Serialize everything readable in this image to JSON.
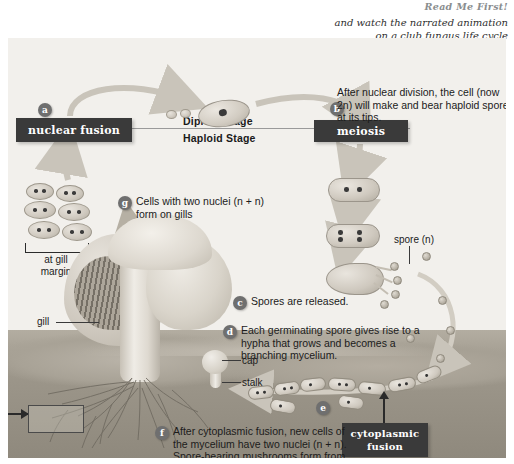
{
  "header": {
    "read_me": "Read Me First!",
    "subtitle_line1": "and watch the narrated animation",
    "subtitle_line2": "on a club fungus life cycle"
  },
  "stages": {
    "diploid": "Diploid Stage",
    "haploid": "Haploid Stage"
  },
  "boxes": {
    "nuclear_fusion": "nuclear fusion",
    "meiosis": "meiosis",
    "cytoplasmic_fusion_line1": "cytoplasmic",
    "cytoplasmic_fusion_line2": "fusion"
  },
  "badges": {
    "a": "a",
    "b": "b",
    "c": "c",
    "d": "d",
    "e": "e",
    "f": "f",
    "g": "g"
  },
  "callouts": {
    "b_text": "After nuclear division, the cell (now 2n) will make and bear haploid spores at its tips.",
    "g_text": "Cells with two nuclei (n + n) form on gills",
    "c_text": "Spores are released.",
    "d_text": "Each germinating spore gives rise to a hypha that grows and becomes a branching mycelium.",
    "f_text": "After cytoplasmic fusion, new cells of the mycelium have two nuclei (n + n). Spore-bearing mushrooms form from this mycelium."
  },
  "part_labels": {
    "at_gill_margin_line1": "at gill",
    "at_gill_margin_line2": "margin",
    "gill": "gill",
    "cap": "cap",
    "stalk": "stalk",
    "spore": "spore (n)"
  },
  "colors": {
    "canvas_bg": "#f2f0ec",
    "dark_box": "#3a3a3a",
    "badge": "#6f6f6f",
    "soil": "#9d978b",
    "text": "#1b1b1b"
  }
}
